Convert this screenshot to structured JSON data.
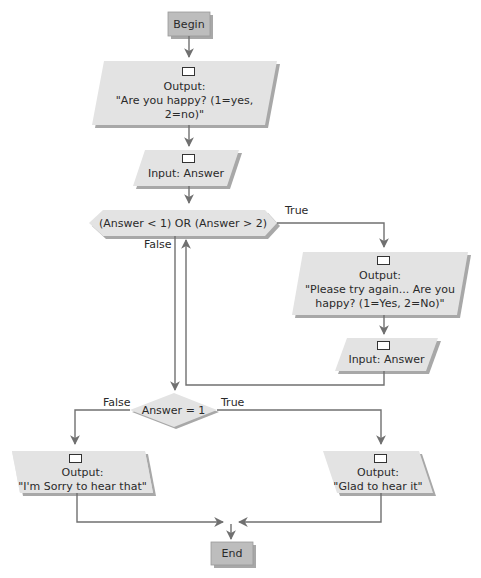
{
  "colors": {
    "shape_fill": "#e3e3e3",
    "terminal_fill": "#bdbdbd",
    "shadow": "#a8a8a8",
    "connector": "#707070",
    "text": "#2a2a2a"
  },
  "nodes": {
    "begin": {
      "type": "terminal",
      "label": "Begin"
    },
    "output_ask": {
      "type": "output",
      "icon": "output-box-icon",
      "line1": "Output:",
      "line2": "\"Are you happy? (1=yes,",
      "line3": "2=no)\""
    },
    "input_answer_1": {
      "type": "input",
      "icon": "input-box-icon",
      "label": "Input: Answer"
    },
    "decision_range": {
      "type": "decision",
      "label": "(Answer < 1) OR (Answer > 2)"
    },
    "output_retry": {
      "type": "output",
      "icon": "output-box-icon",
      "line1": "Output:",
      "line2": "\"Please try again... Are you",
      "line3": "happy? (1=Yes, 2=No)\""
    },
    "input_answer_2": {
      "type": "input",
      "icon": "input-box-icon",
      "label": "Input: Answer"
    },
    "decision_eq": {
      "type": "decision",
      "label": "Answer = 1"
    },
    "output_sorry": {
      "type": "output",
      "icon": "output-box-icon",
      "line1": "Output:",
      "line2": "\"I'm Sorry to hear that\""
    },
    "output_glad": {
      "type": "output",
      "icon": "output-box-icon",
      "line1": "Output:",
      "line2": "\"Glad to hear it\""
    },
    "end": {
      "type": "terminal",
      "label": "End"
    }
  },
  "edges": {
    "range_true": "True",
    "range_false": "False",
    "eq_false": "False",
    "eq_true": "True"
  }
}
